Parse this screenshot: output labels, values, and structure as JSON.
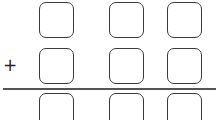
{
  "problem": {
    "operator": "+",
    "rows": [
      {
        "name": "addend-1",
        "digits": [
          "",
          "",
          ""
        ]
      },
      {
        "name": "addend-2",
        "digits": [
          "",
          "",
          ""
        ]
      },
      {
        "name": "sum",
        "digits": [
          "",
          "",
          ""
        ]
      }
    ]
  }
}
